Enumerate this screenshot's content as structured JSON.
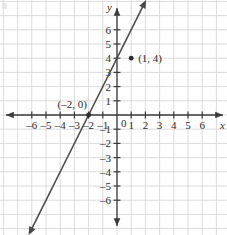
{
  "chart_data": {
    "type": "line",
    "title": "",
    "xlabel": "x",
    "ylabel": "y",
    "grid": true,
    "legend": null,
    "xlim": [
      -6.9,
      7.2
    ],
    "ylim": [
      -7.2,
      6.9
    ],
    "x_ticks": [
      -6,
      -5,
      -4,
      -3,
      -2,
      -1,
      0,
      1,
      2,
      3,
      4,
      5,
      6
    ],
    "y_ticks": [
      -6,
      -5,
      -4,
      -3,
      -2,
      -1,
      1,
      2,
      3,
      4,
      5,
      6
    ],
    "x_tick_labels": [
      "–6",
      "–5",
      "–4",
      "–3",
      "–2",
      "–1",
      "0",
      "1",
      "2",
      "3",
      "4",
      "5",
      "6"
    ],
    "y_tick_labels": [
      "–6",
      "–5",
      "–4",
      "–3",
      "–2",
      "–1",
      "1",
      "2",
      "3",
      "4",
      "5",
      "6"
    ],
    "origin_label": "0",
    "series": [
      {
        "name": "line",
        "kind": "line",
        "slope": 2,
        "intercept": 4,
        "equation": "y = 2x + 4",
        "x": [
          -6.9,
          3.3
        ],
        "y": [
          -9.8,
          10.6
        ],
        "arrow_start": true,
        "arrow_end": true,
        "color": "#4a4a4a"
      }
    ],
    "points": [
      {
        "x": -2,
        "y": 0,
        "label": "(–2, 0)",
        "label_dx": -31,
        "label_dy": -7
      },
      {
        "x": 1,
        "y": 4,
        "label": "(1, 4)",
        "label_dx": 7,
        "label_dy": 4
      }
    ],
    "annotations": [],
    "colors": {
      "grid": "#dcdcdc",
      "axis": "#3a3a3a",
      "line": "#4a4a4a",
      "point": "#2b2b2b",
      "text": "#2b2b2b",
      "background": "#ffffff"
    }
  }
}
